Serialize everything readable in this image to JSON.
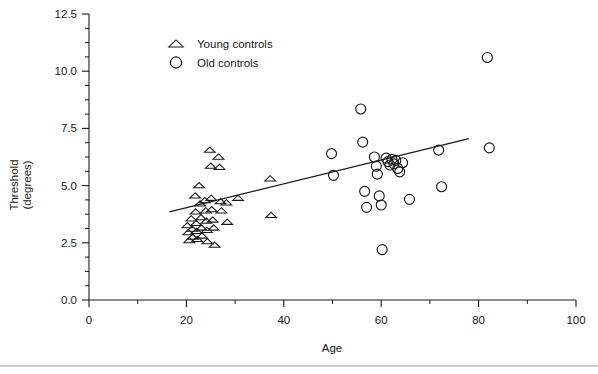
{
  "chart_data": {
    "type": "scatter",
    "title": "",
    "xlabel": "Age",
    "ylabel_line1": "Threshold",
    "ylabel_line2": "(degrees)",
    "xlim": [
      0,
      100
    ],
    "ylim": [
      0.0,
      12.5
    ],
    "xticks": [
      0,
      20,
      40,
      60,
      80,
      100
    ],
    "xtick_labels": [
      "0",
      "20",
      "40",
      "60",
      "80",
      "100"
    ],
    "xminor_step": 10,
    "yticks": [
      0.0,
      2.5,
      5.0,
      7.5,
      10.0,
      12.5
    ],
    "ytick_labels": [
      "0.0",
      "2.5",
      "5.0",
      "7.5",
      "10.0",
      "12.5"
    ],
    "yminor_step": 0.625,
    "grid": false,
    "legend_position": "upper-left-inside",
    "legend": [
      {
        "marker": "triangle",
        "label": "Young controls"
      },
      {
        "marker": "circle",
        "label": "Old controls"
      }
    ],
    "series": [
      {
        "name": "Young controls",
        "marker": "triangle",
        "points": [
          [
            20.2,
            3.25
          ],
          [
            20.4,
            2.95
          ],
          [
            20.6,
            2.6
          ],
          [
            21.0,
            3.55
          ],
          [
            21.2,
            3.1
          ],
          [
            21.3,
            2.75
          ],
          [
            21.8,
            4.55
          ],
          [
            21.9,
            3.85
          ],
          [
            22.0,
            3.35
          ],
          [
            22.1,
            3.0
          ],
          [
            22.2,
            2.65
          ],
          [
            22.6,
            5.0
          ],
          [
            22.8,
            4.2
          ],
          [
            23.0,
            3.6
          ],
          [
            23.1,
            3.15
          ],
          [
            23.2,
            2.8
          ],
          [
            23.8,
            4.35
          ],
          [
            24.0,
            3.9
          ],
          [
            24.1,
            3.45
          ],
          [
            24.2,
            3.05
          ],
          [
            24.3,
            2.55
          ],
          [
            24.8,
            6.55
          ],
          [
            25.0,
            5.85
          ],
          [
            25.1,
            4.45
          ],
          [
            25.2,
            3.95
          ],
          [
            25.4,
            3.5
          ],
          [
            25.6,
            3.15
          ],
          [
            25.8,
            2.4
          ],
          [
            26.6,
            6.25
          ],
          [
            26.8,
            5.8
          ],
          [
            27.0,
            4.3
          ],
          [
            27.2,
            3.9
          ],
          [
            28.2,
            4.25
          ],
          [
            28.4,
            3.4
          ],
          [
            30.6,
            4.45
          ],
          [
            37.2,
            5.3
          ],
          [
            37.4,
            3.7
          ]
        ]
      },
      {
        "name": "Old controls",
        "marker": "circle",
        "points": [
          [
            49.8,
            6.4
          ],
          [
            50.2,
            5.45
          ],
          [
            55.8,
            8.35
          ],
          [
            56.2,
            6.9
          ],
          [
            56.6,
            4.75
          ],
          [
            57.0,
            4.05
          ],
          [
            58.6,
            6.25
          ],
          [
            59.0,
            5.85
          ],
          [
            59.2,
            5.5
          ],
          [
            59.6,
            4.55
          ],
          [
            60.0,
            4.15
          ],
          [
            60.2,
            2.2
          ],
          [
            61.0,
            6.2
          ],
          [
            61.4,
            6.05
          ],
          [
            61.8,
            5.9
          ],
          [
            62.2,
            6.15
          ],
          [
            62.6,
            5.95
          ],
          [
            63.0,
            6.1
          ],
          [
            63.4,
            5.75
          ],
          [
            63.8,
            5.6
          ],
          [
            64.4,
            6.0
          ],
          [
            65.8,
            4.4
          ],
          [
            71.8,
            6.55
          ],
          [
            72.4,
            4.95
          ],
          [
            81.8,
            10.6
          ],
          [
            82.2,
            6.65
          ]
        ]
      }
    ],
    "fit_line": {
      "name": "regression line",
      "x_start": 16.5,
      "y_start": 3.85,
      "x_end": 78.0,
      "y_end": 7.05
    }
  }
}
